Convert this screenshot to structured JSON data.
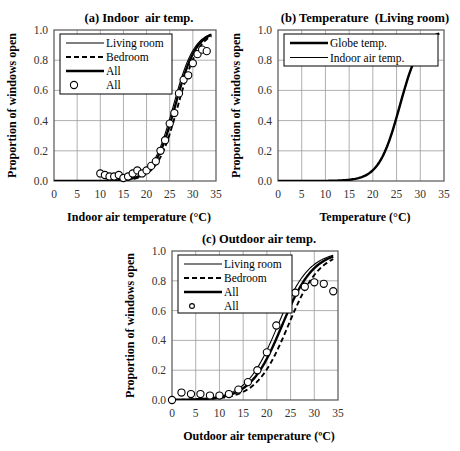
{
  "chart_data": [
    {
      "id": "a",
      "type": "line",
      "title": "(a) Indoor  air temp.",
      "xlabel": "Indoor air temperature (°C)",
      "ylabel": "Proportion of windows open",
      "xlim": [
        0,
        35
      ],
      "ylim": [
        0,
        1.0
      ],
      "xticks": [
        "0",
        "5",
        "10",
        "15",
        "20",
        "25",
        "30",
        "35"
      ],
      "yticks": [
        "0.0",
        "0.2",
        "0.4",
        "0.6",
        "0.8",
        "1.0"
      ],
      "grid": true,
      "legend_position": "upper-left",
      "series": [
        {
          "name": "Living room",
          "kind": "line",
          "style": "thin-solid",
          "logistic": {
            "x50": 25.8,
            "k": 0.44
          },
          "x": [
            0,
            34
          ],
          "note": "logistic fit"
        },
        {
          "name": "Bedroom",
          "kind": "line",
          "style": "dashed",
          "logistic": {
            "x50": 26.8,
            "k": 0.44
          }
        },
        {
          "name": "All",
          "kind": "line",
          "style": "thick-solid",
          "logistic": {
            "x50": 26.2,
            "k": 0.44
          }
        },
        {
          "name": "All",
          "kind": "scatter",
          "marker": "open-circle",
          "x": [
            10,
            11,
            12,
            13,
            14,
            15,
            16,
            17,
            18,
            19,
            20,
            21,
            22,
            23,
            24,
            25,
            26,
            27,
            28,
            29,
            30,
            31,
            32,
            33
          ],
          "y": [
            0.05,
            0.04,
            0.03,
            0.03,
            0.04,
            0.02,
            0.03,
            0.05,
            0.07,
            0.05,
            0.07,
            0.1,
            0.13,
            0.2,
            0.27,
            0.38,
            0.45,
            0.58,
            0.67,
            0.7,
            0.78,
            0.84,
            0.87,
            0.86
          ]
        }
      ]
    },
    {
      "id": "b",
      "type": "line",
      "title": "(b) Temperature  (Living room)",
      "xlabel": "Temperature (°C)",
      "ylabel": "Proportion of windows open",
      "xlim": [
        0,
        35
      ],
      "ylim": [
        0,
        1.0
      ],
      "xticks": [
        "0",
        "5",
        "10",
        "15",
        "20",
        "25",
        "30",
        "35"
      ],
      "yticks": [
        "0.0",
        "0.2",
        "0.4",
        "0.6",
        "0.8",
        "1.0"
      ],
      "grid": true,
      "legend_position": "upper-left",
      "series": [
        {
          "name": "Globe temp.",
          "kind": "line",
          "style": "thick-solid",
          "logistic": {
            "x50": 25.7,
            "k": 0.45
          }
        },
        {
          "name": "Indoor air temp.",
          "kind": "line",
          "style": "thin-solid",
          "logistic": {
            "x50": 25.7,
            "k": 0.45
          }
        }
      ]
    },
    {
      "id": "c",
      "type": "line",
      "title": "(c) Outdoor air temp.",
      "xlabel": "Outdoor air temperature (ºC)",
      "ylabel": "Proportion of windows open",
      "xlim": [
        0,
        35
      ],
      "ylim": [
        0,
        1.0
      ],
      "xticks": [
        "0",
        "5",
        "10",
        "15",
        "20",
        "25",
        "30",
        "35"
      ],
      "yticks": [
        "0.0",
        "0.2",
        "0.4",
        "0.6",
        "0.8",
        "1.0"
      ],
      "grid": true,
      "legend_position": "upper-left",
      "series": [
        {
          "name": "Living room",
          "kind": "line",
          "style": "thin-solid",
          "logistic": {
            "x50": 22.3,
            "k": 0.3
          }
        },
        {
          "name": "Bedroom",
          "kind": "line",
          "style": "dashed",
          "logistic": {
            "x50": 24.5,
            "k": 0.3
          }
        },
        {
          "name": "All",
          "kind": "line",
          "style": "thick-solid",
          "logistic": {
            "x50": 23.2,
            "k": 0.3
          }
        },
        {
          "name": "All",
          "kind": "scatter",
          "marker": "open-circle",
          "x": [
            0,
            2,
            4,
            6,
            8,
            10,
            12,
            14,
            16,
            18,
            20,
            22,
            24,
            26,
            28,
            30,
            32,
            34
          ],
          "y": [
            0.0,
            0.05,
            0.04,
            0.04,
            0.03,
            0.03,
            0.04,
            0.07,
            0.12,
            0.2,
            0.32,
            0.5,
            0.63,
            0.72,
            0.76,
            0.79,
            0.78,
            0.73
          ]
        }
      ]
    }
  ]
}
